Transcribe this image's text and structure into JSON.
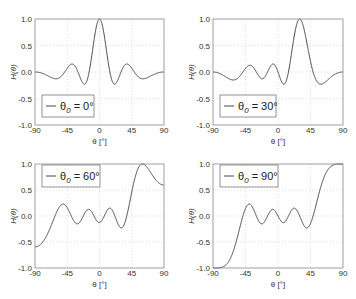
{
  "chart_data": [
    {
      "type": "line",
      "title": "",
      "legend": "θ0 = 0°",
      "legend_position": "lower left",
      "theta0": 0,
      "xlabel": "θ [°]",
      "ylabel": "H(θ)",
      "xlim": [
        -90,
        90
      ],
      "ylim": [
        -1.0,
        1.0
      ],
      "xticks": [
        "-90",
        "-45",
        "0",
        "45",
        "90"
      ],
      "yticks": [
        "-1.0",
        "-0.5",
        "0.0",
        "0.5",
        "1.0"
      ],
      "grid": true,
      "x": [
        -90,
        -75,
        -60,
        -45,
        -30,
        -15,
        0,
        15,
        30,
        45,
        60,
        75,
        90
      ],
      "values": [
        0.0,
        0.05,
        0.1,
        -0.12,
        0.13,
        -0.22,
        1.0,
        -0.22,
        0.13,
        -0.12,
        0.1,
        0.05,
        0.0
      ]
    },
    {
      "type": "line",
      "title": "",
      "legend": "θ0 = 30°",
      "legend_position": "lower left",
      "theta0": 30,
      "xlabel": "θ [°]",
      "ylabel": "H(θ)",
      "xlim": [
        -90,
        90
      ],
      "ylim": [
        -1.0,
        1.0
      ],
      "xticks": [
        "-90",
        "-45",
        "0",
        "45",
        "90"
      ],
      "yticks": [
        "-1.0",
        "-0.5",
        "0.0",
        "0.5",
        "1.0"
      ],
      "grid": true,
      "x": [
        -90,
        -75,
        -60,
        -45,
        -30,
        -15,
        0,
        15,
        30,
        45,
        60,
        75,
        90
      ],
      "values": [
        -0.14,
        -0.08,
        0.1,
        0.05,
        -0.1,
        0.02,
        0.14,
        -0.2,
        1.0,
        -0.05,
        -0.1,
        0.12,
        0.14
      ]
    },
    {
      "type": "line",
      "title": "",
      "legend": "θ0 = 60°",
      "legend_position": "upper left",
      "theta0": 60,
      "xlabel": "θ [°]",
      "ylabel": "H(θ)",
      "xlim": [
        -90,
        90
      ],
      "ylim": [
        -1.0,
        1.0
      ],
      "xticks": [
        "-90",
        "-45",
        "0",
        "45",
        "90"
      ],
      "yticks": [
        "-1.0",
        "-0.5",
        "0.0",
        "0.5",
        "1.0"
      ],
      "grid": true,
      "x": [
        -90,
        -75,
        -60,
        -45,
        -30,
        -15,
        0,
        15,
        30,
        45,
        60,
        75,
        90
      ],
      "values": [
        -0.4,
        -0.2,
        0.2,
        -0.1,
        0.1,
        -0.05,
        0.1,
        -0.05,
        -0.15,
        0.6,
        1.0,
        0.6,
        0.4
      ]
    },
    {
      "type": "line",
      "title": "",
      "legend": "θ0 = 90°",
      "legend_position": "upper left",
      "theta0": 90,
      "xlabel": "θ [°]",
      "ylabel": "H(θ)",
      "xlim": [
        -90,
        90
      ],
      "ylim": [
        -1.0,
        1.0
      ],
      "xticks": [
        "-90",
        "-45",
        "0",
        "45",
        "90"
      ],
      "yticks": [
        "-1.0",
        "-0.5",
        "0.0",
        "0.5",
        "1.0"
      ],
      "grid": true,
      "x": [
        -90,
        -75,
        -60,
        -45,
        -30,
        -15,
        0,
        15,
        30,
        45,
        60,
        75,
        90
      ],
      "values": [
        -1.0,
        -0.85,
        -0.3,
        0.22,
        -0.13,
        0.12,
        -0.1,
        0.1,
        0.12,
        -0.22,
        0.3,
        0.85,
        1.0
      ]
    }
  ],
  "axes": {
    "xlabel": "θ [°]",
    "ylabel": "H(θ)",
    "xticks": [
      "-90",
      "-45",
      "0",
      "45",
      "90"
    ],
    "yticks": [
      "1.0",
      "0.5",
      "0.0",
      "-0.5",
      "-1.0"
    ]
  },
  "legends": [
    {
      "theta": "θ",
      "sub": "0",
      "rest": " = 0°"
    },
    {
      "theta": "θ",
      "sub": "0",
      "rest": " = 30°"
    },
    {
      "theta": "θ",
      "sub": "0",
      "rest": " = 60°"
    },
    {
      "theta": "θ",
      "sub": "0",
      "rest": " = 90°"
    }
  ],
  "colors": {
    "line": "#333333",
    "axis": "#888888",
    "grid": "#c8c8c8"
  },
  "array_elements": 8
}
